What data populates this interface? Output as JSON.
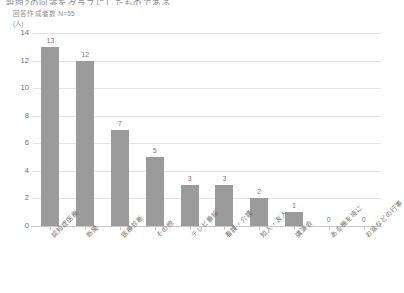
{
  "header": {
    "title_clipped": "設問2の回答をグラフにしたものである",
    "sample_note": "回答作成者数 N=55",
    "unit_label": "(人)"
  },
  "chart_data": {
    "type": "bar",
    "title": "",
    "xlabel": "",
    "ylabel": "(人)",
    "ylim": [
      0,
      14
    ],
    "ytick_step": 2,
    "grid": true,
    "legend": "none",
    "bar_color": "#9b9b9b",
    "gridline_color": "#e4e4e4",
    "axis_color": "#c8c8c8",
    "text_color": "#707070",
    "categories": [
      "認知症医療",
      "新聞",
      "医療診断",
      "その他",
      "テレビ番組",
      "看護・介護",
      "知人・友人",
      "講演会",
      "ある機を境に",
      "お盆などの行事"
    ],
    "values": [
      13,
      12,
      7,
      5,
      3,
      3,
      2,
      1,
      0,
      0
    ],
    "value_labels": [
      "13",
      "12",
      "7",
      "5",
      "3",
      "3",
      "2",
      "1",
      "0",
      "0"
    ],
    "ytick_labels": [
      "0",
      "2",
      "4",
      "6",
      "8",
      "10",
      "12",
      "14"
    ],
    "ytick_values": [
      0,
      2,
      4,
      6,
      8,
      10,
      12,
      14
    ]
  }
}
